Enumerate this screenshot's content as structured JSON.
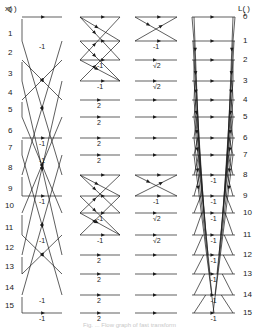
{
  "figure": {
    "input_header": "x( )",
    "output_header": "L( )",
    "output_header_sub": "1",
    "input_indices": [
      "0",
      "1",
      "2",
      "3",
      "4",
      "5",
      "6",
      "7",
      "8",
      "9",
      "10",
      "11",
      "12",
      "13",
      "14",
      "15"
    ],
    "output_indices": [
      "0",
      "1",
      "2",
      "3",
      "4",
      "5",
      "6",
      "7",
      "8",
      "9",
      "10",
      "11",
      "12",
      "13",
      "14",
      "15"
    ],
    "row_y": [
      17,
      41,
      60,
      81,
      100,
      117,
      138,
      155,
      175,
      196,
      213,
      235,
      255,
      274,
      295,
      313
    ],
    "stages": [
      {
        "name": "stage-1",
        "x0": 22,
        "x1": 62,
        "weights": {
          "1": "-1",
          "6": "-1",
          "7": "-1",
          "9": "-1",
          "11": "-1",
          "14": "-1",
          "15": "-1"
        }
      },
      {
        "name": "stage-2",
        "x0": 80,
        "x1": 120,
        "weights": {
          "2": "-1",
          "3": "-1",
          "4": "2",
          "5": "2",
          "6": "2",
          "7": "2",
          "10": "-1",
          "11": "-1",
          "12": "2",
          "13": "2",
          "14": "2",
          "15": "2"
        }
      },
      {
        "name": "stage-3",
        "x0": 135,
        "x1": 177,
        "weights": {
          "1": "-1",
          "2": "√2",
          "3": "√2",
          "9": "-1",
          "10": "√2",
          "11": "√2"
        }
      },
      {
        "name": "stage-4",
        "x0": 192,
        "x1": 235,
        "weights": {
          "8": "-1",
          "9": "-1",
          "10": "-1",
          "11": "-1",
          "12": "-1",
          "13": "-1",
          "14": "-1",
          "15": "-1"
        }
      }
    ],
    "caption": "Fig. ... Flow graph of fast transform"
  }
}
